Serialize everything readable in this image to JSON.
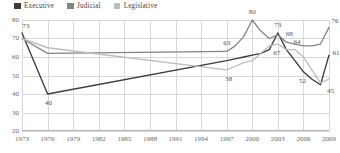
{
  "legend": {
    "items": [
      {
        "label": "Executive",
        "color": "#3c3c3c",
        "key": "executive"
      },
      {
        "label": "Judicial",
        "color": "#858585",
        "key": "judicial"
      },
      {
        "label": "Legislative",
        "color": "#bdbdbd",
        "key": "legislative"
      }
    ]
  },
  "chart_data": {
    "type": "line",
    "title": "",
    "xlabel": "",
    "ylabel": "",
    "ylim": [
      20,
      80
    ],
    "xlim": [
      1973,
      2009
    ],
    "grid": true,
    "legend_position": "top-left",
    "yticks": [
      20,
      30,
      40,
      50,
      60,
      70,
      80
    ],
    "xticks": [
      1973,
      1976,
      1979,
      1982,
      1985,
      1988,
      1991,
      1994,
      1997,
      2000,
      2003,
      2006,
      2009
    ],
    "x": [
      1973,
      1976,
      1997,
      1998,
      1999,
      2000,
      2001,
      2002,
      2003,
      2004,
      2005,
      2006,
      2007,
      2008,
      2009
    ],
    "series": [
      {
        "name": "Executive",
        "color": "#3c3c3c",
        "values": [
          73,
          40,
          58,
          59,
          60,
          61,
          62,
          64,
          73,
          64,
          58,
          52,
          48,
          45,
          61
        ]
      },
      {
        "name": "Judicial",
        "color": "#858585",
        "values": [
          70,
          62,
          63,
          66,
          71,
          80,
          74,
          70,
          72,
          68,
          67,
          66,
          66,
          67,
          76
        ]
      },
      {
        "name": "Legislative",
        "color": "#bdbdbd",
        "values": [
          70,
          65,
          53,
          55,
          57,
          58,
          62,
          66,
          67,
          64,
          64,
          60,
          53,
          46,
          48
        ]
      }
    ],
    "point_labels": [
      {
        "series": "Executive",
        "x": 1973,
        "value": 73,
        "text": "73",
        "dx": 4,
        "dy": -7
      },
      {
        "series": "Executive",
        "x": 1976,
        "value": 40,
        "text": "40",
        "dx": 1,
        "dy": 9
      },
      {
        "series": "Executive",
        "x": 2003,
        "value": 73,
        "text": "73",
        "dx": 0,
        "dy": -8
      },
      {
        "series": "Executive",
        "x": 2006,
        "value": 52,
        "text": "52",
        "dx": -1,
        "dy": 9
      },
      {
        "series": "Executive",
        "x": 2008,
        "value": 45,
        "text": "45",
        "dx": 10,
        "dy": 6
      },
      {
        "series": "Executive",
        "x": 2009,
        "value": 61,
        "text": "61",
        "dx": 7,
        "dy": -2
      },
      {
        "series": "Judicial",
        "x": 1997,
        "value": 63,
        "text": "63",
        "dx": 0,
        "dy": -8
      },
      {
        "series": "Judicial",
        "x": 2000,
        "value": 80,
        "text": "80",
        "dx": 0,
        "dy": -8
      },
      {
        "series": "Judicial",
        "x": 2004,
        "value": 68,
        "text": "68",
        "dx": 3,
        "dy": -8
      },
      {
        "series": "Judicial",
        "x": 2009,
        "value": 76,
        "text": "76",
        "dx": 6,
        "dy": -6
      },
      {
        "series": "Legislative",
        "x": 1997,
        "value": 53,
        "text": "58",
        "dx": 2,
        "dy": 9
      },
      {
        "series": "Legislative",
        "x": 2003,
        "value": 67,
        "text": "67",
        "dx": -1,
        "dy": 9
      },
      {
        "series": "Legislative",
        "x": 2005,
        "value": 64,
        "text": "64",
        "dx": 2,
        "dy": -8
      }
    ]
  }
}
